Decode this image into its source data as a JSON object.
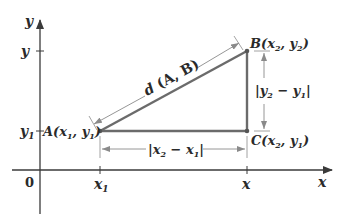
{
  "diagram": {
    "axes": {
      "x_label": "x",
      "y_label": "y",
      "origin_label": "0",
      "x_ticks": [
        {
          "label": "x",
          "sub": "1",
          "pos": 100
        },
        {
          "label": "x",
          "sub": "",
          "pos": 247
        }
      ],
      "y_ticks": [
        {
          "label": "y",
          "sub": "",
          "pos": 51
        },
        {
          "label": "y",
          "sub": "1",
          "pos": 131
        }
      ]
    },
    "points": {
      "A": {
        "name": "A",
        "text": "A(x₁, y₁)"
      },
      "B": {
        "name": "B",
        "text": "B(x₂, y₂)"
      },
      "C": {
        "name": "C",
        "text": "C(x₂, y₁)"
      }
    },
    "dimensions": {
      "hypotenuse": "d (A, B)",
      "horizontal": "|x₂ − x₁|",
      "vertical": "|y₂ − y₁|"
    },
    "colors": {
      "line": "#6b6b6b",
      "axis": "#3a3a3a",
      "text": "#2a2a2a",
      "dim": "#8a8a8a"
    }
  }
}
